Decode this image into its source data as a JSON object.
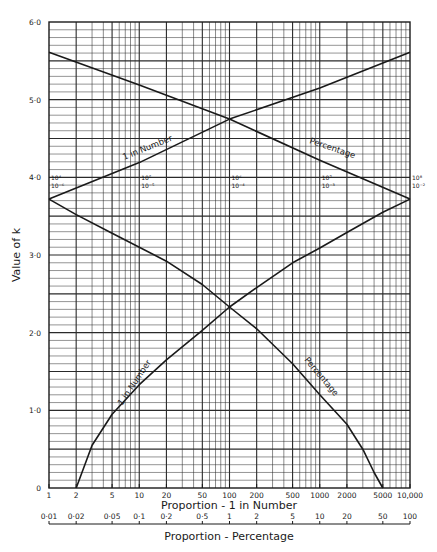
{
  "chart_data": {
    "type": "line",
    "title": "",
    "xlabel": "Proportion - 1 in Number",
    "x2label": "Proportion - Percentage",
    "ylabel": "Value of k",
    "x_scale": "log",
    "xlim": [
      1,
      10000
    ],
    "ylim": [
      0,
      6.0
    ],
    "grid": true,
    "x_ticks": [
      "1",
      "2",
      "5",
      "10",
      "20",
      "50",
      "100",
      "200",
      "500",
      "1000",
      "2000",
      "5000",
      "10,000"
    ],
    "x_tick_values": [
      1,
      2,
      5,
      10,
      20,
      50,
      100,
      200,
      500,
      1000,
      2000,
      5000,
      10000
    ],
    "x2_ticks": [
      "0·01",
      "0·02",
      "0·05",
      "0·1",
      "0·2",
      "0·5",
      "1",
      "2",
      "5",
      "10",
      "20",
      "50",
      "100"
    ],
    "x2_tick_values": [
      0.01,
      0.02,
      0.05,
      0.1,
      0.2,
      0.5,
      1,
      2,
      5,
      10,
      20,
      50,
      100
    ],
    "y_ticks": [
      "0",
      "1·0",
      "2·0",
      "3·0",
      "4·0",
      "5·0",
      "6·0"
    ],
    "y_tick_values": [
      0,
      1,
      2,
      3,
      4,
      5,
      6
    ],
    "upper_scale_markers": [
      {
        "x": 1,
        "top": "10⁴",
        "bottom": "10⁻⁶"
      },
      {
        "x": 10,
        "top": "10⁵",
        "bottom": "10⁻⁵"
      },
      {
        "x": 100,
        "top": "10⁶",
        "bottom": "10⁻⁴"
      },
      {
        "x": 1000,
        "top": "10⁷",
        "bottom": "10⁻³"
      },
      {
        "x": 10000,
        "top": "10⁸",
        "bottom": "10⁻²"
      }
    ],
    "series": [
      {
        "name": "1 in Number",
        "segment": "upper",
        "x": [
          1,
          10,
          100,
          1000,
          10000
        ],
        "values": [
          3.72,
          4.19,
          4.75,
          5.15,
          5.61
        ]
      },
      {
        "name": "Percentage",
        "segment": "upper",
        "x": [
          1,
          10,
          100,
          1000,
          10000
        ],
        "values": [
          5.61,
          5.19,
          4.75,
          4.22,
          3.72
        ]
      },
      {
        "name": "1 in Number",
        "segment": "lower",
        "x": [
          2,
          3,
          5,
          10,
          20,
          50,
          100,
          200,
          500,
          1000,
          2000,
          5000,
          10000
        ],
        "values": [
          0,
          0.55,
          0.95,
          1.33,
          1.65,
          2.03,
          2.33,
          2.58,
          2.9,
          3.09,
          3.29,
          3.55,
          3.72
        ]
      },
      {
        "name": "Percentage",
        "segment": "lower",
        "x": [
          1,
          2,
          5,
          10,
          20,
          50,
          100,
          200,
          500,
          1000,
          2000,
          3000,
          4000,
          5000
        ],
        "values": [
          3.72,
          3.52,
          3.28,
          3.1,
          2.92,
          2.62,
          2.33,
          2.05,
          1.6,
          1.2,
          0.82,
          0.5,
          0.2,
          0
        ]
      }
    ],
    "annotations": [
      "1 in Number",
      "Percentage",
      "1 in Number",
      "Percentage"
    ],
    "legend": null
  },
  "labels": {
    "xlabel": "Proportion - 1 in Number",
    "x2label": "Proportion - Percentage",
    "ylabel": "Value of k",
    "curve_upper_number": "1 in Number",
    "curve_upper_percentage": "Percentage",
    "curve_lower_number": "1 in Number",
    "curve_lower_percentage": "Percentage"
  },
  "colors": {
    "ink": "#1a1a1a",
    "grid": "#2a2a2a",
    "background": "#ffffff"
  }
}
